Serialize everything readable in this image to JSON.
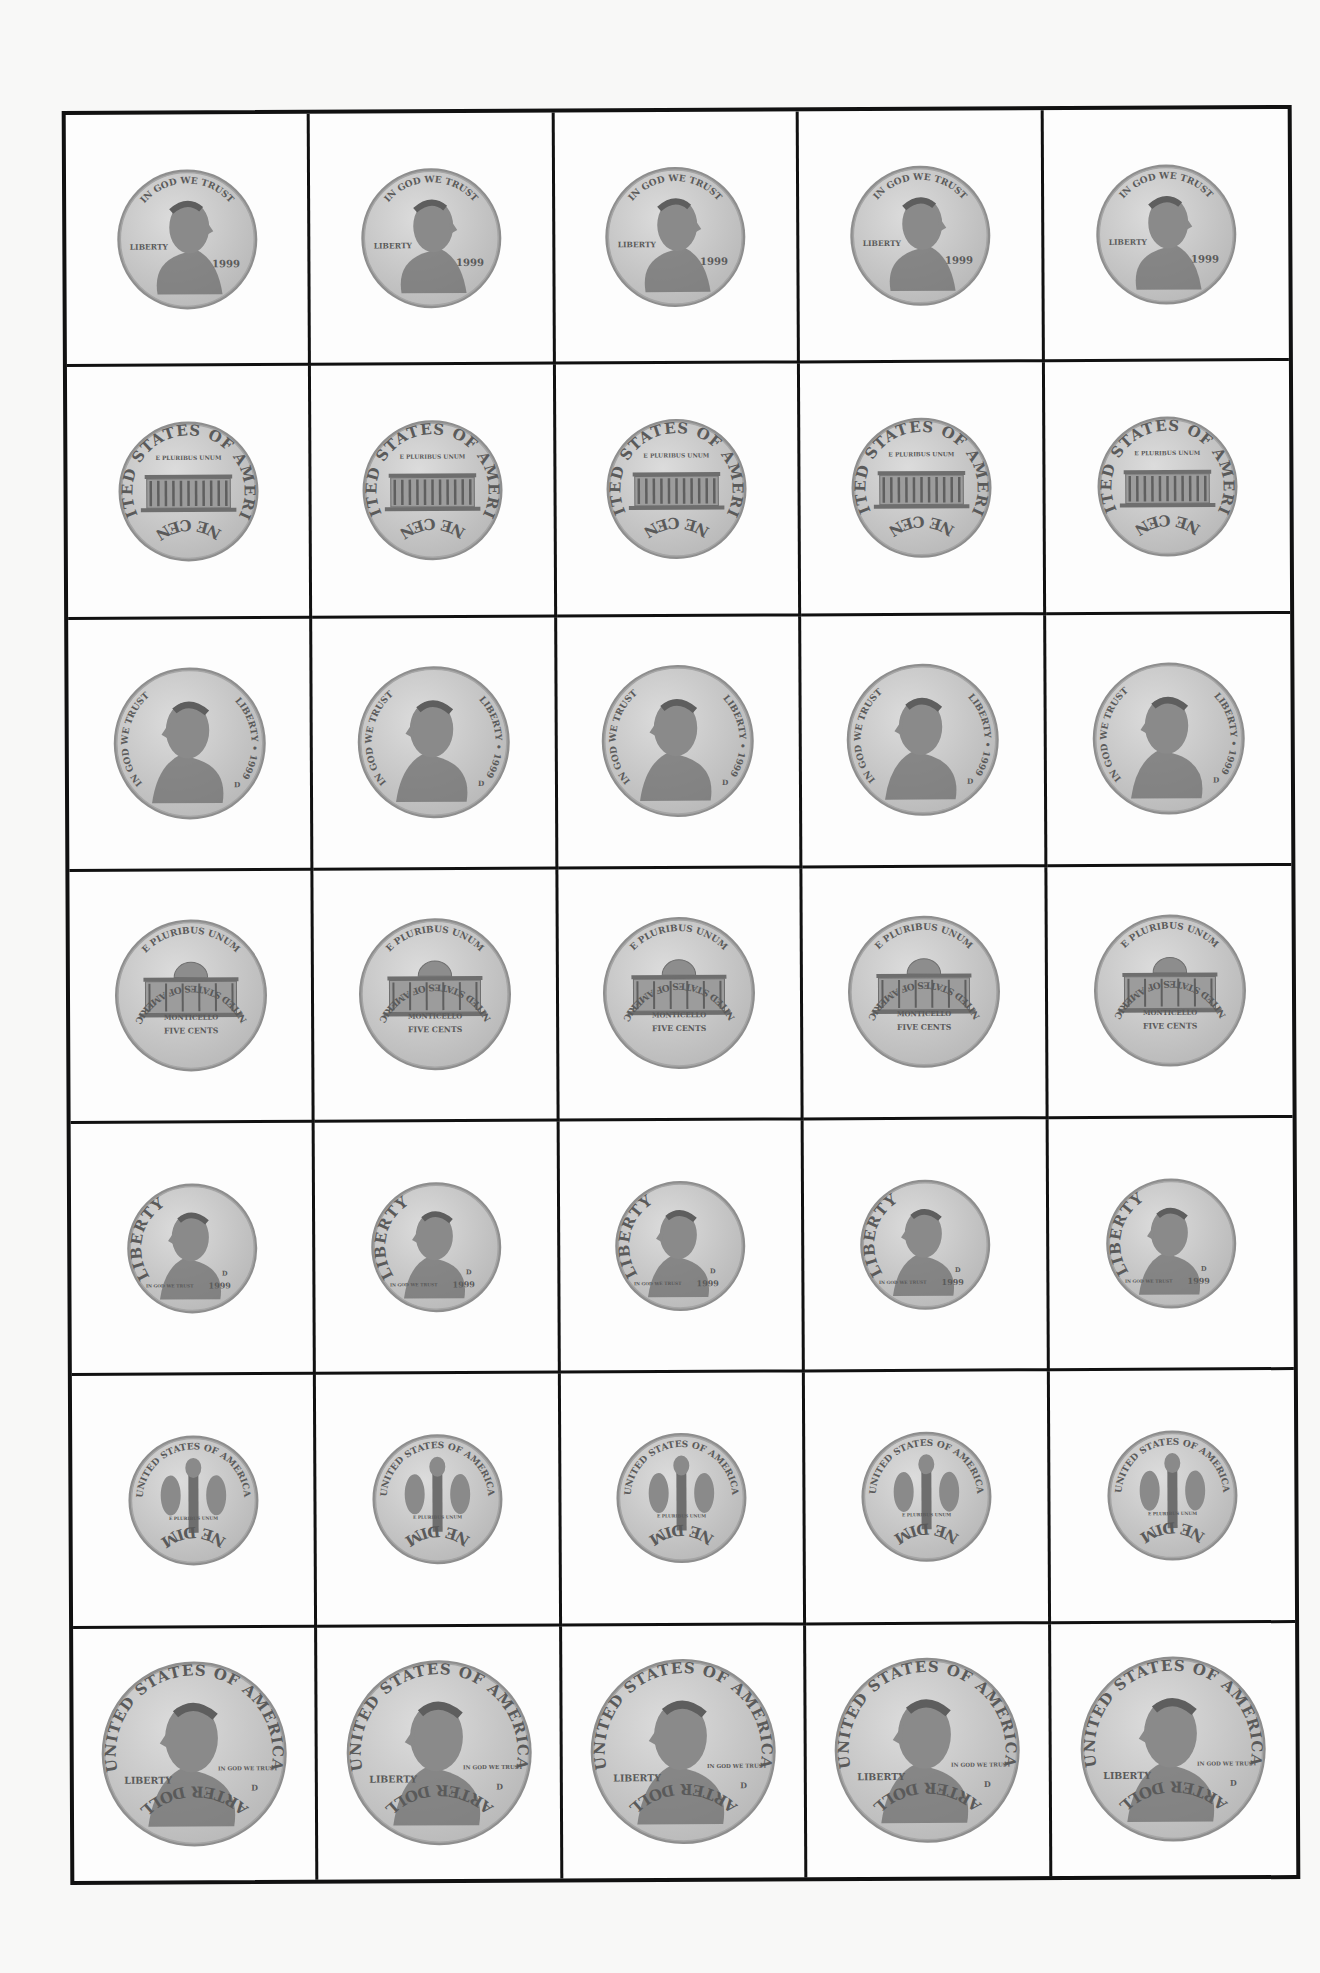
{
  "sheet": {
    "columns": 5,
    "rows": 7,
    "border_color": "#111111",
    "background": "#fdfdfd"
  },
  "coin_color": {
    "face": "#b9b9b9",
    "face_light": "#dcdcdc",
    "rim": "#8e8e8e",
    "relief": "#6e6e6e"
  },
  "rows": [
    {
      "coin": "penny",
      "side": "obverse",
      "diameter": 140,
      "top_text": "IN GOD WE TRUST",
      "left_text": "LIBERTY",
      "year": "1999",
      "portrait": "lincoln-portrait",
      "count": 5
    },
    {
      "coin": "penny",
      "side": "reverse",
      "diameter": 140,
      "top_text": "UNITED STATES OF AMERICA",
      "motto": "E PLURIBUS UNUM",
      "bottom_text": "ONE CENT",
      "building": "lincoln-memorial",
      "count": 5
    },
    {
      "coin": "nickel",
      "side": "obverse",
      "diameter": 152,
      "left_text": "IN GOD WE TRUST",
      "right_text": "LIBERTY • 1999",
      "mint_mark": "D",
      "portrait": "jefferson-portrait",
      "count": 5
    },
    {
      "coin": "nickel",
      "side": "reverse",
      "diameter": 152,
      "top_text": "E PLURIBUS UNUM",
      "building_label": "MONTICELLO",
      "value_text": "FIVE CENTS",
      "bottom_text": "UNITED STATES OF AMERICA",
      "building": "monticello",
      "count": 5
    },
    {
      "coin": "dime",
      "side": "obverse",
      "diameter": 130,
      "left_text": "LIBERTY",
      "motto": "IN GOD WE TRUST",
      "year": "1999",
      "mint_mark": "D",
      "portrait": "roosevelt-portrait",
      "count": 5
    },
    {
      "coin": "dime",
      "side": "reverse",
      "diameter": 130,
      "top_text": "UNITED STATES OF AMERICA",
      "motto": "E PLURIBUS UNUM",
      "bottom_text": "ONE DIME",
      "emblem": "torch-olive-oak",
      "count": 5
    },
    {
      "coin": "quarter",
      "side": "obverse",
      "diameter": 185,
      "top_text": "UNITED STATES OF AMERICA",
      "left_text": "LIBERTY",
      "motto": "IN GOD WE TRUST",
      "mint_mark": "D",
      "bottom_text": "QUARTER DOLLAR",
      "portrait": "washington-portrait",
      "count": 5
    }
  ]
}
